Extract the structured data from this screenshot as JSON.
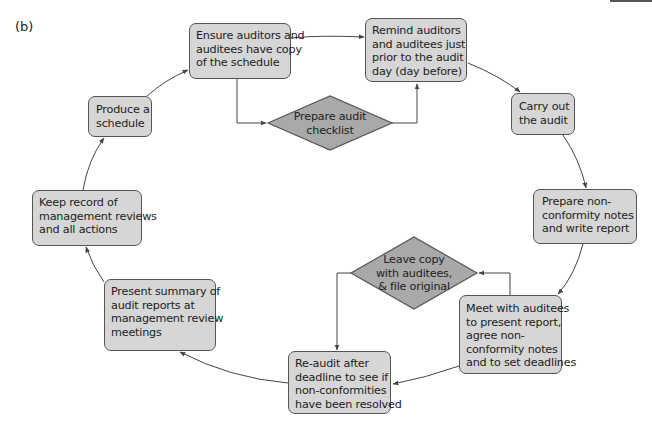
{
  "figure": {
    "panel_label": "(b)",
    "colors": {
      "box_fill": "#d6d6d6",
      "diamond_fill": "#a9a9a9",
      "stroke": "#555555",
      "text": "#222222"
    }
  },
  "nodes": {
    "produce_schedule": {
      "shape": "rounded-rect",
      "lines": [
        "Produce a",
        "schedule"
      ]
    },
    "ensure_copy": {
      "shape": "rounded-rect",
      "lines": [
        "Ensure auditors and",
        "auditees have copy",
        "of the schedule"
      ]
    },
    "prepare_checklist": {
      "shape": "diamond",
      "lines": [
        "Prepare audit",
        "checklist"
      ]
    },
    "remind": {
      "shape": "rounded-rect",
      "lines": [
        "Remind auditors",
        "and auditees just",
        "prior to the audit",
        "day (day before)"
      ]
    },
    "carry_out": {
      "shape": "rounded-rect",
      "lines": [
        "Carry out",
        "the audit"
      ]
    },
    "prepare_nonconformity": {
      "shape": "rounded-rect",
      "lines": [
        "Prepare non-",
        "conformity notes",
        "and write report"
      ]
    },
    "meet_auditees": {
      "shape": "rounded-rect",
      "lines": [
        "Meet with auditees",
        "to present report,",
        "agree non-",
        "conformity notes",
        "and to set deadlines"
      ]
    },
    "leave_copy": {
      "shape": "diamond",
      "lines": [
        "Leave copy",
        "with auditees,",
        "& file original"
      ]
    },
    "re_audit": {
      "shape": "rounded-rect",
      "lines": [
        "Re-audit after",
        "deadline to see if",
        "non-conformities",
        "have been resolved"
      ]
    },
    "present_summary": {
      "shape": "rounded-rect",
      "lines": [
        "Present summary of",
        "audit reports at",
        "management review",
        "meetings"
      ]
    },
    "keep_record": {
      "shape": "rounded-rect",
      "lines": [
        "Keep record of",
        "management reviews",
        "and all actions"
      ]
    }
  },
  "edges": [
    {
      "from": "produce_schedule",
      "to": "ensure_copy"
    },
    {
      "from": "ensure_copy",
      "to": "remind"
    },
    {
      "from": "ensure_copy",
      "to": "prepare_checklist"
    },
    {
      "from": "prepare_checklist",
      "to": "remind"
    },
    {
      "from": "remind",
      "to": "carry_out"
    },
    {
      "from": "carry_out",
      "to": "prepare_nonconformity"
    },
    {
      "from": "prepare_nonconformity",
      "to": "meet_auditees"
    },
    {
      "from": "meet_auditees",
      "to": "leave_copy"
    },
    {
      "from": "leave_copy",
      "to": "re_audit"
    },
    {
      "from": "meet_auditees",
      "to": "re_audit"
    },
    {
      "from": "re_audit",
      "to": "present_summary"
    },
    {
      "from": "present_summary",
      "to": "keep_record"
    },
    {
      "from": "keep_record",
      "to": "produce_schedule"
    }
  ]
}
